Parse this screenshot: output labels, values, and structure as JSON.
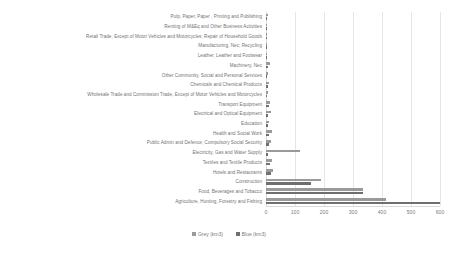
{
  "chart_data": {
    "type": "bar",
    "orientation": "horizontal",
    "title": "",
    "xlabel": "",
    "ylabel": "",
    "xlim": [
      0,
      600
    ],
    "grid": true,
    "legend_position": "bottom",
    "xticks": [
      "0",
      "100",
      "200",
      "300",
      "400",
      "500",
      "600"
    ],
    "xtick_values": [
      0,
      100,
      200,
      300,
      400,
      500,
      600
    ],
    "categories": [
      "Pulp, Paper, Paper , Printing and Publishing",
      "Renting of M&Eq and Other Business Activities",
      "Retail Trade, Except of Motor Vehicles and Motorcycles; Repair of Household Goods",
      "Manufacturing, Nec; Recycling",
      "Leather, Leather and Footwear",
      "Machinery, Nec",
      "Other Community, Social and Personal Services",
      "Chemicals and Chemical Products",
      "Wholesale Trade and Commission Trade, Except of Motor Vehicles and Motorcycles",
      "Transport Equipment",
      "Electrical and Optical Equipment",
      "Education",
      "Health and Social Work",
      "Public Admin and Defence; Compulsory Social Security",
      "Electricity, Gas and Water Supply",
      "Textiles and Textile Products",
      "Hotels and Restaurants",
      "Construction",
      "Food, Beverages and Tobacco",
      "Agriculture, Hunting, Forestry and Fishing"
    ],
    "series": [
      {
        "name": "Grey (km3)",
        "color": "#9a9a9a",
        "values": [
          6,
          5,
          5,
          4,
          4,
          13,
          6,
          12,
          6,
          14,
          16,
          9,
          19,
          17,
          117,
          22,
          24,
          190,
          335,
          415
        ]
      },
      {
        "name": "Blue (km3)",
        "color": "#6f6f6f",
        "values": [
          3,
          3,
          4,
          4,
          3,
          6,
          4,
          7,
          4,
          9,
          8,
          7,
          12,
          11,
          8,
          13,
          16,
          155,
          335,
          600
        ]
      }
    ]
  },
  "legend": {
    "items": [
      {
        "label": "Grey (km3)",
        "color": "#9a9a9a"
      },
      {
        "label": "Blue (km3)",
        "color": "#6f6f6f"
      }
    ]
  }
}
